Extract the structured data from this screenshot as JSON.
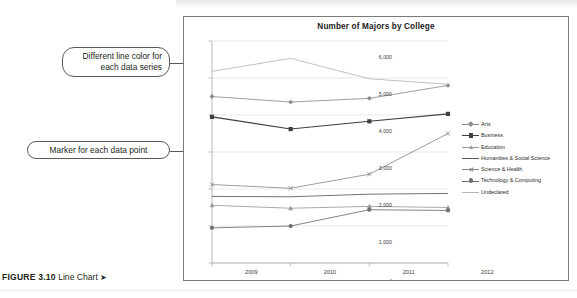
{
  "figure": {
    "number": "FIGURE 3.10",
    "label": "Line Chart",
    "arrow": "➤"
  },
  "annotations": [
    {
      "id": "line-color",
      "text": "Different line color for each data series"
    },
    {
      "id": "marker",
      "text": "Marker for each data point"
    }
  ],
  "colors": {
    "frame_border": "#7a7a7a",
    "gridline": "#d9d9d9",
    "axis": "#a6a6a6",
    "arts": "#8c8c8c",
    "business": "#404040",
    "education": "#9a9a9a",
    "humanities": "#595959",
    "science_health": "#8a8a8a",
    "technology_computing": "#6e6e6e",
    "undeclared": "#b5b5b5",
    "callout_border": "#58595b",
    "text": "#231f20"
  },
  "chart_data": {
    "type": "line",
    "title": "Number of Majors by College",
    "xlabel": "",
    "ylabel": "",
    "categories": [
      "2009",
      "2010",
      "2011",
      "2012"
    ],
    "ylim": [
      0,
      6000
    ],
    "yticks": [
      "-",
      "1,000",
      "2,000",
      "3,000",
      "4,000",
      "5,000",
      "6,000"
    ],
    "ytick_values": [
      0,
      1000,
      2000,
      3000,
      4000,
      5000,
      6000
    ],
    "grid": true,
    "legend_position": "right",
    "series": [
      {
        "name": "Arts",
        "marker": "diamond",
        "color": "#8c8c8c",
        "values": [
          4500,
          4350,
          4450,
          4800
        ]
      },
      {
        "name": "Business",
        "marker": "square",
        "color": "#404040",
        "values": [
          3950,
          3620,
          3830,
          4030
        ]
      },
      {
        "name": "Education",
        "marker": "triangle",
        "color": "#9a9a9a",
        "values": [
          1560,
          1480,
          1530,
          1500
        ]
      },
      {
        "name": "Humanities & Social Science",
        "marker": "none",
        "color": "#595959",
        "values": [
          1800,
          1790,
          1860,
          1880
        ]
      },
      {
        "name": "Science & Health",
        "marker": "x",
        "color": "#8a8a8a",
        "values": [
          2120,
          2020,
          2400,
          3500
        ]
      },
      {
        "name": "Technology & Computing",
        "marker": "circle",
        "color": "#6e6e6e",
        "values": [
          950,
          1000,
          1440,
          1420
        ]
      },
      {
        "name": "Undeclared",
        "marker": "none",
        "color": "#b5b5b5",
        "values": [
          5180,
          5530,
          4980,
          4830
        ]
      }
    ]
  }
}
